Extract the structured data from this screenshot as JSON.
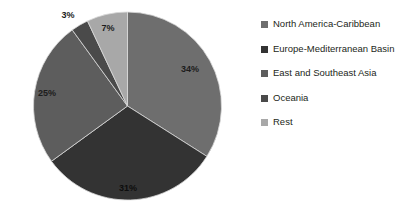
{
  "chart_data": {
    "type": "pie",
    "title": "",
    "subtitle": "",
    "xlabel": "",
    "ylabel": "",
    "legend_position": "right",
    "grid": false,
    "start_angle_deg": 0,
    "direction": "clockwise",
    "categories": [
      "North America-Caribbean",
      "Europe-Mediterranean Basin",
      "East and Southeast Asia",
      "Oceania",
      "Rest"
    ],
    "values": [
      34,
      31,
      25,
      3,
      7
    ],
    "value_unit": "%",
    "data_labels": [
      "34%",
      "31%",
      "25%",
      "3%",
      "7%"
    ],
    "colors": [
      "#6e6e6e",
      "#333333",
      "#5d5d5d",
      "#4a4a4a",
      "#a8a8a8"
    ],
    "slices": [
      {
        "label": "North America-Caribbean",
        "value": 34,
        "data_label": "34%",
        "color": "#6e6e6e"
      },
      {
        "label": "Europe-Mediterranean Basin",
        "value": 31,
        "data_label": "31%",
        "color": "#333333"
      },
      {
        "label": "East and Southeast Asia",
        "value": 25,
        "data_label": "25%",
        "color": "#5d5d5d"
      },
      {
        "label": "Oceania",
        "value": 3,
        "data_label": "3%",
        "color": "#4a4a4a"
      },
      {
        "label": "Rest",
        "value": 7,
        "data_label": "7%",
        "color": "#a8a8a8"
      }
    ]
  },
  "legend": {
    "items": [
      {
        "label": "North America-Caribbean",
        "color": "#6e6e6e"
      },
      {
        "label": "Europe-Mediterranean Basin",
        "color": "#333333"
      },
      {
        "label": "East and Southeast Asia",
        "color": "#5d5d5d"
      },
      {
        "label": "Oceania",
        "color": "#4a4a4a"
      },
      {
        "label": "Rest",
        "color": "#a8a8a8"
      }
    ]
  },
  "labels": {
    "slice_0": "34%",
    "slice_1": "31%",
    "slice_2": "25%",
    "slice_3": "3%",
    "slice_4": "7%"
  }
}
